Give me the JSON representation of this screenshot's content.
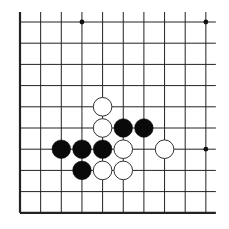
{
  "board": {
    "title": "Go problem diagram",
    "columns": 10,
    "rows": 10,
    "origin_x": 20,
    "origin_y": 22,
    "spacing_x": 20.65,
    "spacing_y": 21.2,
    "open_edges": [
      "top",
      "right"
    ],
    "thick_edges": [
      "left",
      "bottom"
    ],
    "line_color": "#222222",
    "star_points": [
      [
        3,
        0
      ],
      [
        9,
        0
      ],
      [
        9,
        6
      ]
    ],
    "stones": [
      {
        "color": "white",
        "col": 4,
        "row": 4
      },
      {
        "color": "white",
        "col": 4,
        "row": 5
      },
      {
        "color": "black",
        "col": 5,
        "row": 5
      },
      {
        "color": "black",
        "col": 6,
        "row": 5
      },
      {
        "color": "black",
        "col": 2,
        "row": 6
      },
      {
        "color": "black",
        "col": 3,
        "row": 6
      },
      {
        "color": "black",
        "col": 4,
        "row": 6
      },
      {
        "color": "white",
        "col": 5,
        "row": 6
      },
      {
        "color": "white",
        "col": 7,
        "row": 6
      },
      {
        "color": "black",
        "col": 3,
        "row": 7
      },
      {
        "color": "white",
        "col": 4,
        "row": 7
      },
      {
        "color": "white",
        "col": 5,
        "row": 7
      }
    ]
  }
}
